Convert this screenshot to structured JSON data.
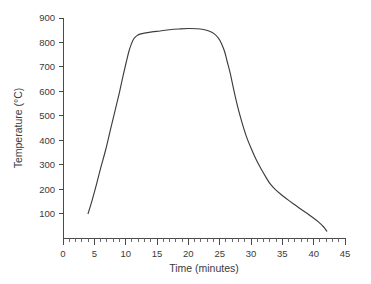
{
  "chart_data": {
    "type": "line",
    "title": "",
    "xlabel": "Time (minutes)",
    "ylabel": "Temperature (°C)",
    "xlim": [
      0,
      45
    ],
    "ylim": [
      0,
      900
    ],
    "grid": false,
    "legend": null,
    "x_major_ticks": [
      0,
      5,
      10,
      15,
      20,
      25,
      30,
      35,
      40,
      45
    ],
    "x_major_tick_labels": [
      "0",
      "5",
      "10",
      "15",
      "20",
      "25",
      "30",
      "35",
      "40",
      "45"
    ],
    "x_minor_tick_step": 1,
    "y_major_ticks": [
      100,
      200,
      300,
      400,
      500,
      600,
      700,
      800,
      900
    ],
    "y_major_tick_labels": [
      "100",
      "200",
      "300",
      "400",
      "500",
      "600",
      "700",
      "800",
      "900"
    ],
    "series": [
      {
        "name": "Thermal profile",
        "color": "#3d3d3d",
        "x": [
          4.0,
          4.6,
          5.3,
          6.0,
          6.8,
          7.5,
          8.2,
          9.0,
          9.6,
          10.1,
          10.5,
          10.9,
          11.3,
          11.8,
          12.4,
          13.2,
          14.2,
          15.5,
          17.0,
          18.5,
          20.0,
          21.3,
          22.4,
          23.3,
          24.1,
          24.8,
          25.3,
          25.8,
          26.2,
          26.7,
          27.2,
          27.8,
          28.5,
          29.2,
          30.0,
          30.8,
          31.6,
          32.4,
          33.1,
          33.9,
          34.8,
          35.8,
          36.8,
          37.8,
          38.8,
          39.8,
          40.8,
          41.6,
          42.1
        ],
        "y": [
          100,
          150,
          215,
          285,
          360,
          435,
          510,
          595,
          665,
          720,
          762,
          793,
          815,
          828,
          835,
          839,
          843,
          847,
          852,
          855,
          857,
          856,
          853,
          847,
          836,
          818,
          795,
          762,
          722,
          672,
          612,
          545,
          478,
          420,
          368,
          322,
          283,
          248,
          220,
          198,
          178,
          158,
          139,
          121,
          103,
          85,
          65,
          45,
          28
        ]
      }
    ],
    "annotations": []
  },
  "layout": {
    "plot_left_px": 63,
    "plot_right_px": 345,
    "plot_baseline_px": 238,
    "plot_top_px": 18
  }
}
